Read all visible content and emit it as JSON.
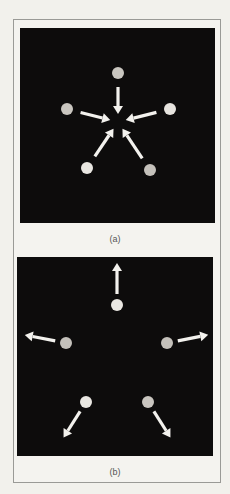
{
  "figure": {
    "panels": [
      {
        "id": "a",
        "label": "(a)",
        "arrow_direction": "inward",
        "center": [
          98,
          94
        ],
        "dots": [
          {
            "x": 98,
            "y": 45,
            "color": "#c9c6c0"
          },
          {
            "x": 47,
            "y": 81,
            "color": "#c9c6c0"
          },
          {
            "x": 150,
            "y": 81,
            "color": "#e6e4df"
          },
          {
            "x": 67,
            "y": 140,
            "color": "#e9e7e2"
          },
          {
            "x": 130,
            "y": 142,
            "color": "#c4c1bb"
          }
        ]
      },
      {
        "id": "b",
        "label": "(b)",
        "arrow_direction": "outward",
        "center": [
          100,
          96
        ],
        "dots": [
          {
            "x": 100,
            "y": 48,
            "color": "#e9e7e2"
          },
          {
            "x": 49,
            "y": 86,
            "color": "#c4c1bb"
          },
          {
            "x": 150,
            "y": 86,
            "color": "#c4c1bb"
          },
          {
            "x": 69,
            "y": 145,
            "color": "#e9e7e2"
          },
          {
            "x": 131,
            "y": 145,
            "color": "#c9c6c0"
          }
        ]
      }
    ],
    "colors": {
      "background": "#f2f1ec",
      "panel": "#0d0c0c",
      "arrow": "#f3f2ee",
      "frame": "#9a9a96"
    }
  }
}
